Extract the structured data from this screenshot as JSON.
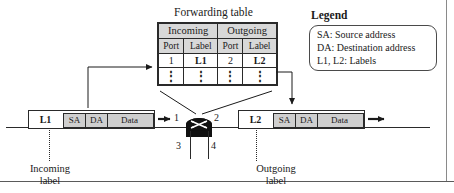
{
  "diagram": {
    "forwarding_table": {
      "title": "Forwarding table",
      "group_headers": [
        "Incoming",
        "Outgoing"
      ],
      "column_headers": [
        "Port",
        "Label",
        "Port",
        "Label"
      ],
      "rows": [
        [
          "1",
          "L1",
          "2",
          "L2"
        ],
        [
          "⋮",
          "⋮",
          "⋮",
          "⋮"
        ]
      ]
    },
    "legend": {
      "title": "Legend",
      "entries": [
        "SA:  Source address",
        "DA: Destination address",
        "L1, L2: Labels"
      ]
    },
    "incoming_packet": {
      "label": "L1",
      "fields": [
        "SA",
        "DA",
        "Data"
      ]
    },
    "outgoing_packet": {
      "label": "L2",
      "fields": [
        "SA",
        "DA",
        "Data"
      ]
    },
    "router": {
      "icon": "switch-crossbar-icon",
      "ports": [
        "1",
        "2",
        "3",
        "4"
      ]
    },
    "captions": {
      "incoming": "Incoming\nlabel",
      "incoming_line1": "Incoming",
      "incoming_line2": "label",
      "outgoing_line1": "Outgoing",
      "outgoing_line2": "label"
    },
    "colors": {
      "ink": "#1a1a1a",
      "line": "#2a2a2a",
      "header_fill": "#d8d8d8",
      "payload_fill": "#cfcfcf",
      "router_fill": "#111111"
    }
  }
}
